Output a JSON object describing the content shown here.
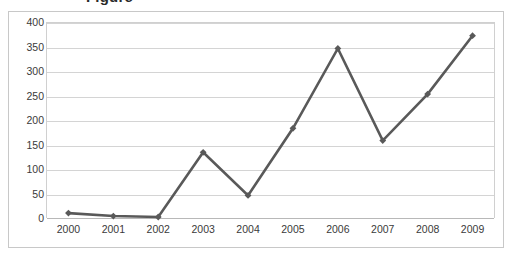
{
  "title_fragment": "Figure",
  "chart_data": {
    "type": "line",
    "title": "",
    "xlabel": "",
    "ylabel": "",
    "categories": [
      "2000",
      "2001",
      "2002",
      "2003",
      "2004",
      "2005",
      "2006",
      "2007",
      "2008",
      "2009"
    ],
    "series": [
      {
        "name": "Series 1",
        "values": [
          10,
          4,
          2,
          134,
          46,
          183,
          346,
          158,
          253,
          372
        ],
        "color": "#595959",
        "marker": "diamond"
      }
    ],
    "ylim": [
      0,
      400
    ],
    "yticks": [
      0,
      50,
      100,
      150,
      200,
      250,
      300,
      350,
      400
    ],
    "ytick_labels": [
      "0",
      "50",
      "100",
      "150",
      "200",
      "250",
      "300",
      "350",
      "400"
    ],
    "grid": true,
    "grid_axis": "y",
    "legend": false,
    "legend_position": "none",
    "plot_background": "#ffffff",
    "gridline_color": "#d4d4d4",
    "border_color": "#c8c8c8",
    "text_color": "#3a3a3a"
  }
}
